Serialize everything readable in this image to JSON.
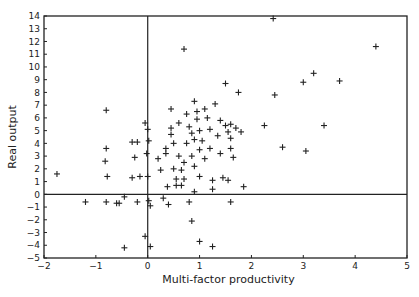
{
  "chart_data": {
    "type": "scatter",
    "title": "",
    "xlabel": "Multi-factor productivity",
    "ylabel": "Real output",
    "xlim": [
      -2,
      5
    ],
    "ylim": [
      -5,
      14
    ],
    "xticks": [
      -2,
      -1,
      0,
      1,
      2,
      3,
      4,
      5
    ],
    "yticks": [
      -5,
      -4,
      -3,
      -2,
      -1,
      0,
      1,
      2,
      3,
      4,
      5,
      6,
      7,
      8,
      9,
      10,
      11,
      12,
      13,
      14
    ],
    "grid": false,
    "zero_lines": true,
    "marker": "+",
    "colors": {
      "ink": "#222222",
      "background": "#ffffff"
    },
    "points": [
      {
        "x": -1.75,
        "y": 1.6
      },
      {
        "x": -1.2,
        "y": -0.6
      },
      {
        "x": -0.8,
        "y": 6.6
      },
      {
        "x": -0.8,
        "y": 3.6
      },
      {
        "x": -0.82,
        "y": 2.6
      },
      {
        "x": -0.78,
        "y": 1.4
      },
      {
        "x": -0.8,
        "y": -0.6
      },
      {
        "x": -0.6,
        "y": -0.7
      },
      {
        "x": -0.55,
        "y": -0.7
      },
      {
        "x": -0.45,
        "y": -0.2
      },
      {
        "x": -0.45,
        "y": -4.2
      },
      {
        "x": -0.3,
        "y": 4.1
      },
      {
        "x": -0.2,
        "y": 4.1
      },
      {
        "x": -0.25,
        "y": 2.9
      },
      {
        "x": -0.3,
        "y": 1.3
      },
      {
        "x": -0.15,
        "y": 1.4
      },
      {
        "x": -0.2,
        "y": -0.6
      },
      {
        "x": -0.05,
        "y": 5.6
      },
      {
        "x": -0.05,
        "y": -3.3
      },
      {
        "x": 0.0,
        "y": 5.1
      },
      {
        "x": 0.02,
        "y": 4.2
      },
      {
        "x": -0.02,
        "y": 3.2
      },
      {
        "x": 0.0,
        "y": 1.4
      },
      {
        "x": 0.02,
        "y": -0.5
      },
      {
        "x": 0.05,
        "y": -0.9
      },
      {
        "x": 0.05,
        "y": -4.1
      },
      {
        "x": 0.2,
        "y": 2.8
      },
      {
        "x": 0.25,
        "y": 1.9
      },
      {
        "x": 0.3,
        "y": -0.3
      },
      {
        "x": 0.35,
        "y": 3.6
      },
      {
        "x": 0.35,
        "y": 3.2
      },
      {
        "x": 0.38,
        "y": 0.6
      },
      {
        "x": 0.4,
        "y": -0.8
      },
      {
        "x": 0.45,
        "y": 6.7
      },
      {
        "x": 0.45,
        "y": 5.2
      },
      {
        "x": 0.45,
        "y": 4.7
      },
      {
        "x": 0.5,
        "y": 4.0
      },
      {
        "x": 0.5,
        "y": 2.0
      },
      {
        "x": 0.55,
        "y": 1.2
      },
      {
        "x": 0.55,
        "y": 0.7
      },
      {
        "x": 0.6,
        "y": 5.6
      },
      {
        "x": 0.6,
        "y": 3.0
      },
      {
        "x": 0.65,
        "y": 1.9
      },
      {
        "x": 0.65,
        "y": 0.7
      },
      {
        "x": 0.7,
        "y": 2.5
      },
      {
        "x": 0.7,
        "y": 1.2
      },
      {
        "x": 0.75,
        "y": 6.3
      },
      {
        "x": 0.75,
        "y": 4.0
      },
      {
        "x": 0.8,
        "y": 5.3
      },
      {
        "x": 0.8,
        "y": -0.6
      },
      {
        "x": 0.85,
        "y": 4.8
      },
      {
        "x": 0.85,
        "y": 3.0
      },
      {
        "x": 0.9,
        "y": 7.3
      },
      {
        "x": 0.9,
        "y": 4.3
      },
      {
        "x": 0.9,
        "y": 2.2
      },
      {
        "x": 0.9,
        "y": 0.2
      },
      {
        "x": 0.95,
        "y": 6.5
      },
      {
        "x": 0.95,
        "y": 5.9
      },
      {
        "x": 1.0,
        "y": 5.0
      },
      {
        "x": 1.0,
        "y": 3.5
      },
      {
        "x": 1.0,
        "y": 1.4
      },
      {
        "x": 1.0,
        "y": -3.7
      },
      {
        "x": 0.85,
        "y": -2.1
      },
      {
        "x": 0.7,
        "y": 11.4
      },
      {
        "x": 1.05,
        "y": 4.2
      },
      {
        "x": 1.1,
        "y": 6.7
      },
      {
        "x": 1.1,
        "y": 2.8
      },
      {
        "x": 1.15,
        "y": 6.0
      },
      {
        "x": 1.2,
        "y": 5.1
      },
      {
        "x": 1.2,
        "y": 3.6
      },
      {
        "x": 1.25,
        "y": 1.1
      },
      {
        "x": 1.25,
        "y": 0.4
      },
      {
        "x": 1.25,
        "y": -4.1
      },
      {
        "x": 1.3,
        "y": 7.1
      },
      {
        "x": 1.35,
        "y": 4.6
      },
      {
        "x": 1.4,
        "y": 5.8
      },
      {
        "x": 1.4,
        "y": 3.2
      },
      {
        "x": 1.45,
        "y": 1.3
      },
      {
        "x": 1.5,
        "y": 8.7
      },
      {
        "x": 1.5,
        "y": 5.4
      },
      {
        "x": 1.55,
        "y": 4.9
      },
      {
        "x": 1.55,
        "y": 1.1
      },
      {
        "x": 1.6,
        "y": 5.5
      },
      {
        "x": 1.6,
        "y": 4.4
      },
      {
        "x": 1.6,
        "y": 3.6
      },
      {
        "x": 1.6,
        "y": -0.6
      },
      {
        "x": 1.65,
        "y": 2.9
      },
      {
        "x": 1.7,
        "y": 5.2
      },
      {
        "x": 1.75,
        "y": 8.0
      },
      {
        "x": 1.8,
        "y": 4.9
      },
      {
        "x": 1.85,
        "y": 0.6
      },
      {
        "x": 2.25,
        "y": 5.4
      },
      {
        "x": 2.42,
        "y": 13.8
      },
      {
        "x": 2.45,
        "y": 7.8
      },
      {
        "x": 2.6,
        "y": 3.7
      },
      {
        "x": 3.0,
        "y": 8.8
      },
      {
        "x": 3.05,
        "y": 3.4
      },
      {
        "x": 3.2,
        "y": 9.5
      },
      {
        "x": 3.4,
        "y": 5.4
      },
      {
        "x": 3.7,
        "y": 8.9
      },
      {
        "x": 4.4,
        "y": 11.6
      }
    ]
  }
}
